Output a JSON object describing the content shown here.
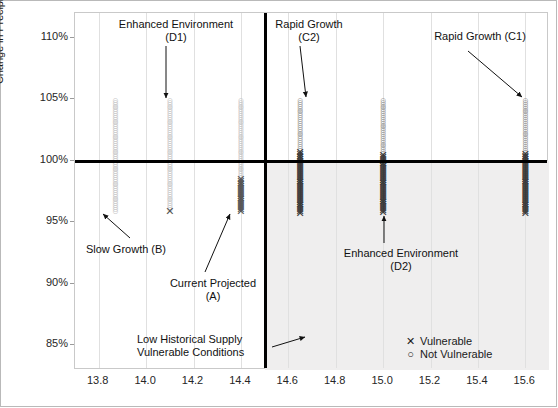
{
  "chart_data": {
    "type": "scatter",
    "title": "",
    "xlabel": "",
    "ylabel": "Change in Precipitation from Historical 1950-1999 Baseline [%]",
    "xlim": [
      13.7,
      15.7
    ],
    "ylim": [
      83.0,
      112.0
    ],
    "xticks": [
      "13.8",
      "14.0",
      "14.2",
      "14.4",
      "14.6",
      "14.8",
      "15.0",
      "15.2",
      "15.4",
      "15.6"
    ],
    "xtick_values": [
      13.8,
      14.0,
      14.2,
      14.4,
      14.6,
      14.8,
      15.0,
      15.2,
      15.4,
      15.6
    ],
    "yticks": [
      "110%",
      "105%",
      "100%",
      "95%",
      "90%",
      "85%"
    ],
    "ytick_values": [
      110,
      105,
      100,
      95,
      90,
      85
    ],
    "grid": "vertical-only",
    "legend_position": "inside-bottom-right",
    "threshold_lines": {
      "horizontal_y": 100,
      "vertical_x": 14.5
    },
    "shaded_quadrant": {
      "label": "Low Historical Supply Vulnerable Conditions",
      "x_from": 14.5,
      "x_to": 15.7,
      "y_from": 83.0,
      "y_to": 100
    },
    "series": [
      {
        "name": "Slow Growth (B)",
        "code": "B",
        "x": 13.87,
        "marker": "circle",
        "vulnerable": false,
        "y_min": 95.9,
        "y_max": 104.9,
        "n_points": 60,
        "vulnerable_count": 0
      },
      {
        "name": "Enhanced Environment (D1)",
        "code": "D1",
        "x": 14.1,
        "marker": "mixed",
        "vulnerable": false,
        "y_min": 95.9,
        "y_max": 104.9,
        "n_points": 60,
        "vulnerable_count": 1
      },
      {
        "name": "Current Projected (A)",
        "code": "A",
        "x": 14.4,
        "marker": "mixed",
        "vulnerable": true,
        "y_min": 95.9,
        "y_max": 104.9,
        "n_points": 60,
        "vulnerable_count": 18
      },
      {
        "name": "Rapid Growth (C2)",
        "code": "C2",
        "x": 14.65,
        "marker": "mixed",
        "vulnerable": true,
        "y_min": 95.7,
        "y_max": 104.9,
        "n_points": 60,
        "vulnerable_count": 33
      },
      {
        "name": "Enhanced Environment (D2)",
        "code": "D2",
        "x": 15.0,
        "marker": "mixed",
        "vulnerable": true,
        "y_min": 95.8,
        "y_max": 104.9,
        "n_points": 60,
        "vulnerable_count": 31
      },
      {
        "name": "Rapid Growth (C1)",
        "code": "C1",
        "x": 15.6,
        "marker": "mixed",
        "vulnerable": true,
        "y_min": 95.7,
        "y_max": 104.9,
        "n_points": 60,
        "vulnerable_count": 32
      }
    ],
    "legend": [
      {
        "glyph": "✕",
        "label": "Vulnerable"
      },
      {
        "glyph": "○",
        "label": "Not Vulnerable"
      }
    ],
    "annotations": [
      {
        "id": "d1",
        "line1": "Enhanced Environment",
        "line2": "(D1)"
      },
      {
        "id": "c2",
        "line1": "Rapid Growth",
        "line2": "(C2)"
      },
      {
        "id": "c1",
        "line1": "Rapid Growth (C1)",
        "line2": ""
      },
      {
        "id": "b",
        "line1": "Slow Growth (B)",
        "line2": ""
      },
      {
        "id": "a",
        "line1": "Current Projected",
        "line2": "(A)"
      },
      {
        "id": "d2",
        "line1": "Enhanced Environment",
        "line2": "(D2)"
      },
      {
        "id": "lhs",
        "line1": "Low Historical Supply",
        "line2": "Vulnerable Conditions"
      }
    ]
  },
  "colors": {
    "marker_circle": "#c6c6c6",
    "marker_x": "#555555",
    "threshold": "#000000",
    "shade": "#efeeee",
    "grid": "#e0e0e0",
    "frame": "#b9b9b9"
  }
}
